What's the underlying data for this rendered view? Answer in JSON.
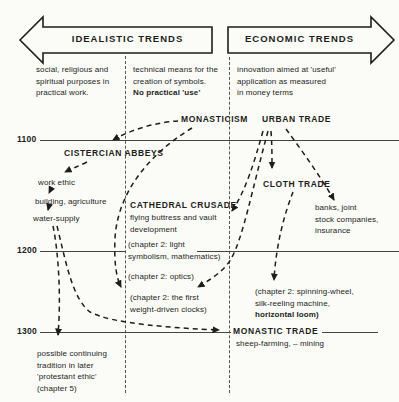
{
  "colors": {
    "ink": "#1d1d1b",
    "paper": "#fbfbf8"
  },
  "banners": {
    "idealistic": "IDEALISTIC TRENDS",
    "economic": "ECONOMIC TRENDS"
  },
  "principles": {
    "idealistic_social": [
      "social, religious and",
      "spiritual purposes in",
      "practical work."
    ],
    "idealistic_technical": [
      "technical means for the",
      "creation of symbols."
    ],
    "idealistic_technical_bold": "No  practical 'use'",
    "economic": [
      "innovation aimed at 'useful'",
      "application as measured",
      "in money terms"
    ]
  },
  "timeline": {
    "t1100": "1100",
    "t1200": "1200",
    "t1300": "1300"
  },
  "nodes": {
    "monasticism": "MONASTICISM",
    "urban_trade": "URBAN TRADE",
    "cistercian_abbeys": "CISTERCIAN ABBEYS",
    "work_ethic": "work ethic",
    "building_agriculture": "building, agriculture",
    "water_supply": "water-supply",
    "cathedral_crusade": "CATHEDRAL CRUSADE",
    "cathedral_sub": [
      "flying buttress and vault",
      "development"
    ],
    "cloth_trade": "CLOTH TRADE",
    "banks": [
      "banks, joint",
      "stock companies,",
      "insurance"
    ],
    "ch2_light": [
      "(chapter 2: light",
      "symbolism, mathematics)"
    ],
    "ch2_optics": "(chapter 2: optics)",
    "ch2_clocks": [
      "(chapter 2: the  first",
      "weight-driven clocks)"
    ],
    "ch2_spinning": [
      "(chapter 2: spinning-wheel,",
      "silk-reeling machine,"
    ],
    "ch2_spinning_bold": "horizontal loom)",
    "monastic_trade": "MONASTIC TRADE",
    "monastic_trade_sub": "sheep-farming, – mining",
    "protestant": [
      "possible continuing",
      "tradition in later",
      "'protestant ethic'",
      "(chapter 5)"
    ]
  },
  "connections": [
    {
      "from": "monasticism",
      "to": "cistercian_abbeys"
    },
    {
      "from": "monasticism",
      "to": "ch2_clocks"
    },
    {
      "from": "urban_trade",
      "to": "cathedral_crusade"
    },
    {
      "from": "urban_trade",
      "to": "ch2_clocks"
    },
    {
      "from": "urban_trade",
      "to": "cloth_trade"
    },
    {
      "from": "urban_trade",
      "to": "banks"
    },
    {
      "from": "cloth_trade",
      "to": "ch2_spinning"
    },
    {
      "from": "cistercian_abbeys",
      "to": "work_ethic"
    },
    {
      "from": "work_ethic",
      "to": "building_agriculture"
    },
    {
      "from": "building_agriculture",
      "to": "water_supply"
    },
    {
      "from": "water_supply",
      "to": "protestant"
    },
    {
      "from": "water_supply",
      "to": "monastic_trade"
    }
  ]
}
